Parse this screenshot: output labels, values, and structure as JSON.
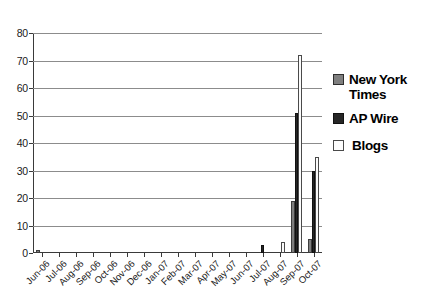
{
  "chart_data": {
    "type": "bar",
    "title": "",
    "xlabel": "",
    "ylabel": "",
    "ylim": [
      0,
      80
    ],
    "ytick_step": 10,
    "yticks": [
      0,
      10,
      20,
      30,
      40,
      50,
      60,
      70,
      80
    ],
    "grid": "horizontal",
    "legend_position": "right",
    "grouping": "clustered",
    "categories": [
      "Jun-06",
      "Jul-06",
      "Aug-06",
      "Sep-06",
      "Oct-06",
      "Nov-06",
      "Dec-06",
      "Jan-07",
      "Feb-07",
      "Mar-07",
      "Apr-07",
      "May-07",
      "Jun-07",
      "Jul-07",
      "Aug-07",
      "Sep-07",
      "Oct-07"
    ],
    "series": [
      {
        "name": "New York Times",
        "color": "#7f7f7f",
        "values": [
          1,
          0,
          0,
          0,
          0,
          0,
          0,
          0,
          0,
          0,
          0,
          0,
          0,
          0,
          0,
          19,
          5
        ]
      },
      {
        "name": "AP Wire",
        "color": "#262626",
        "values": [
          0,
          0,
          0,
          0,
          0,
          0,
          0,
          0,
          0,
          0,
          0,
          0,
          0,
          3,
          0,
          51,
          30
        ]
      },
      {
        "name": "Blogs",
        "color": "#fbfbfb",
        "values": [
          0,
          0,
          0,
          0,
          0,
          0,
          0,
          0,
          0,
          0,
          0,
          0,
          0,
          0,
          4,
          72,
          35
        ]
      }
    ]
  },
  "legend": {
    "entries": [
      {
        "label": "New York Times",
        "swatch": "nyt"
      },
      {
        "label": "AP Wire",
        "swatch": "ap"
      },
      {
        "label": "Blogs",
        "swatch": "blogs"
      }
    ]
  },
  "colors": {
    "new_york_times": "#7f7f7f",
    "ap_wire": "#262626",
    "blogs": "#fbfbfb",
    "axis": "#3a3a3a",
    "gridline": "#8c8c8c",
    "background": "#ffffff"
  }
}
